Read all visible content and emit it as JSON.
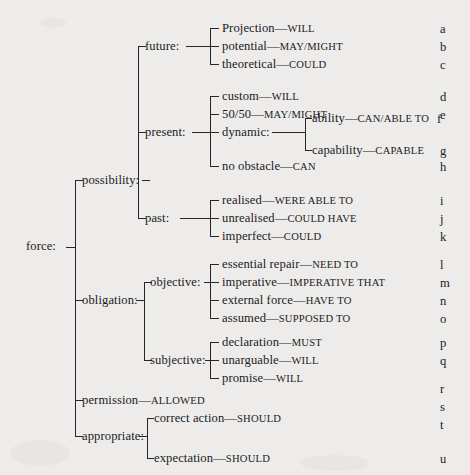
{
  "diagram": {
    "title": "force:",
    "root_label": "force:",
    "letter_column_label": "key-letters",
    "nodes": {
      "force": "force:",
      "possibility": "possibility:",
      "obligation": "obligation:",
      "permission": "permission—ALLOWED",
      "appropriate": "appropriate:",
      "future": "future:",
      "present": "present:",
      "past": "past:",
      "objective": "objective:",
      "subjective": "subjective:",
      "dynamic": "dynamic:"
    },
    "leaves": [
      {
        "letter": "a",
        "term": "Projection",
        "modal": "WILL",
        "text": "Projection—WILL"
      },
      {
        "letter": "b",
        "term": "potential",
        "modal": "MAY/MIGHT",
        "text": "potential—MAY/MIGHT"
      },
      {
        "letter": "c",
        "term": "theoretical",
        "modal": "COULD",
        "text": "theoretical—COULD"
      },
      {
        "letter": "d",
        "term": "custom",
        "modal": "WILL",
        "text": "custom—WILL"
      },
      {
        "letter": "e",
        "term": "50/50",
        "modal": "MAY/MIGHT",
        "text": "50/50—MAY/MIGHT"
      },
      {
        "letter": "f",
        "term": "ability",
        "modal": "CAN/ABLE TO",
        "text": "ability—CAN/ABLE TO"
      },
      {
        "letter": "g",
        "term": "capability",
        "modal": "CAPABLE",
        "text": "capability—CAPABLE"
      },
      {
        "letter": "h",
        "term": "no obstacle",
        "modal": "CAN",
        "text": "no obstacle—CAN"
      },
      {
        "letter": "i",
        "term": "realised",
        "modal": "WERE ABLE TO",
        "text": "realised—WERE ABLE TO"
      },
      {
        "letter": "j",
        "term": "unrealised",
        "modal": "COULD HAVE",
        "text": "unrealised—COULD HAVE"
      },
      {
        "letter": "k",
        "term": "imperfect",
        "modal": "COULD",
        "text": "imperfect—COULD"
      },
      {
        "letter": "l",
        "term": "essential repair",
        "modal": "NEED TO",
        "text": "essential repair—NEED TO"
      },
      {
        "letter": "m",
        "term": "imperative",
        "modal": "IMPERATIVE THAT",
        "text": "imperative—IMPERATIVE THAT"
      },
      {
        "letter": "n",
        "term": "external force",
        "modal": "HAVE TO",
        "text": "external force—HAVE TO"
      },
      {
        "letter": "o",
        "term": "assumed",
        "modal": "SUPPOSED TO",
        "text": "assumed—SUPPOSED TO"
      },
      {
        "letter": "p",
        "term": "declaration",
        "modal": "MUST",
        "text": "declaration—MUST"
      },
      {
        "letter": "q",
        "term": "unarguable",
        "modal": "WILL",
        "text": "unarguable—WILL"
      },
      {
        "letter": "r",
        "term": "promise",
        "modal": "WILL",
        "text": "promise—WILL"
      },
      {
        "letter": "s",
        "term": "permission",
        "modal": "ALLOWED",
        "text": "permission—ALLOWED"
      },
      {
        "letter": "t",
        "term": "correct action",
        "modal": "SHOULD",
        "text": "correct action—SHOULD"
      },
      {
        "letter": "u",
        "term": "expectation",
        "modal": "SHOULD",
        "text": "expectation—SHOULD"
      }
    ],
    "letters": [
      "a",
      "b",
      "c",
      "d",
      "e",
      "f",
      "g",
      "h",
      "i",
      "j",
      "k",
      "l",
      "m",
      "n",
      "o",
      "p",
      "q",
      "r",
      "s",
      "t",
      "u"
    ],
    "colors": {
      "ink": "#1b1b1b",
      "paper": "#edeceb",
      "rule": "#262626"
    }
  }
}
